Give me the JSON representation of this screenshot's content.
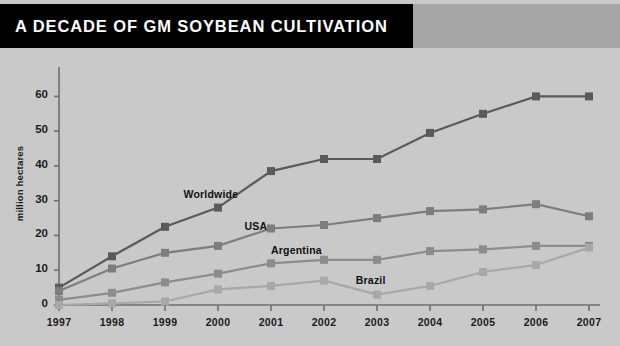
{
  "header": {
    "title": "A DECADE OF GM SOYBEAN CULTIVATION",
    "bar_color": "#000000",
    "band_color": "#a6a6a6",
    "text_color": "#ffffff"
  },
  "page": {
    "background": "#c9c9c9"
  },
  "chart_data": {
    "type": "line",
    "title": "A DECADE OF GM SOYBEAN CULTIVATION",
    "xlabel": "",
    "ylabel": "million hectares",
    "x": [
      1997,
      1998,
      1999,
      2000,
      2001,
      2002,
      2003,
      2004,
      2005,
      2006,
      2007
    ],
    "categories": [
      "1997",
      "1998",
      "1999",
      "2000",
      "2001",
      "2002",
      "2003",
      "2004",
      "2005",
      "2006",
      "2007"
    ],
    "ylim": [
      0,
      65
    ],
    "xlim": [
      1997,
      2007
    ],
    "yticks": [
      0,
      10,
      20,
      30,
      40,
      50,
      60
    ],
    "ytick_labels": [
      "0",
      "10",
      "20",
      "30",
      "40",
      "50",
      "60"
    ],
    "grid": false,
    "legend_position": "inline-annotations",
    "marker": "square",
    "series": [
      {
        "name": "Worldwide",
        "color": "#5a5a5a",
        "values": [
          5,
          14,
          22.5,
          28,
          38.5,
          42,
          42,
          49.5,
          55,
          60,
          60
        ],
        "label_x": 1999.35,
        "label_y": 31.5
      },
      {
        "name": "USA",
        "color": "#7d7d7d",
        "values": [
          4,
          10.5,
          15,
          17,
          22,
          23,
          25,
          27,
          27.5,
          29,
          25.5
        ],
        "label_x": 2000.5,
        "label_y": 22.5
      },
      {
        "name": "Argentina",
        "color": "#8c8c8c",
        "values": [
          1.5,
          3.5,
          6.5,
          9,
          12,
          13,
          13,
          15.5,
          16,
          17,
          17
        ],
        "label_x": 2001.0,
        "label_y": 15.5
      },
      {
        "name": "Brazil",
        "color": "#a8a8a8",
        "values": [
          0,
          0.5,
          1,
          4.5,
          5.5,
          7,
          3,
          5.5,
          9.5,
          11.5,
          16.5
        ],
        "label_x": 2002.6,
        "label_y": 7.0
      }
    ],
    "axis_color": "#6e6e6e",
    "tick_text_color": "#1a1a1a"
  }
}
